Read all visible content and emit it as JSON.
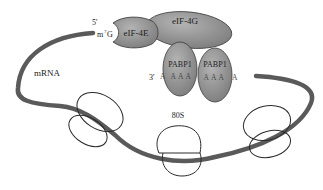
{
  "diagram": {
    "colors": {
      "background": "#ffffff",
      "mrna": "#5a5a5a",
      "protein_fill": "#8f8f8f",
      "protein_fill_light": "#a8a8a8",
      "protein_stroke": "#3a3a3a",
      "ribosome_stroke": "#2a2a2a",
      "text": "#222222"
    },
    "labels": {
      "five_prime": "5'",
      "cap": "m",
      "cap_superscript": "7",
      "cap_suffix": "G",
      "eif4e": "eIF-4E",
      "eif4g": "eIF-4G",
      "pabp_left": "PABP1",
      "pabp_right": "PABP1",
      "three_prime": "3'",
      "poly_a_left_start": "A",
      "poly_a_left": "A A A",
      "poly_a_right": "A A A",
      "poly_a_right_end": "A",
      "mrna": "mRNA",
      "ribosome": "80S"
    },
    "ribosomes": [
      {
        "name": "ribosome-left",
        "label": ""
      },
      {
        "name": "ribosome-middle",
        "label": "80S"
      },
      {
        "name": "ribosome-right",
        "label": ""
      }
    ]
  }
}
